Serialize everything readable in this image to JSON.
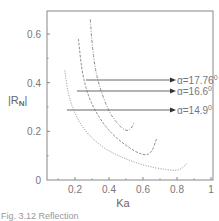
{
  "chart_data": {
    "type": "line",
    "title": "",
    "xlabel": "Ka",
    "ylabel": "|R_N|",
    "xlim": [
      0,
      1
    ],
    "ylim": [
      0,
      0.7
    ],
    "xticks": [
      "0.2",
      "0.4",
      "0.6",
      "0.8",
      "1"
    ],
    "yticks": [
      "0",
      "0.2",
      "0.4",
      "0.6"
    ],
    "grid": false,
    "legend_position": "right-inline-arrows",
    "series": [
      {
        "name": "α=17.76°",
        "style": "dash-dot",
        "x": [
          0.29,
          0.3,
          0.32,
          0.35,
          0.4,
          0.45,
          0.5,
          0.53,
          0.55
        ],
        "y": [
          0.66,
          0.56,
          0.45,
          0.37,
          0.28,
          0.23,
          0.2,
          0.21,
          0.24
        ]
      },
      {
        "name": "α=16.6°",
        "style": "dash",
        "x": [
          0.22,
          0.24,
          0.27,
          0.32,
          0.4,
          0.5,
          0.6,
          0.65,
          0.68
        ],
        "y": [
          0.58,
          0.45,
          0.36,
          0.28,
          0.2,
          0.14,
          0.1,
          0.11,
          0.17
        ]
      },
      {
        "name": "α=14.9°",
        "style": "dotted",
        "x": [
          0.14,
          0.16,
          0.2,
          0.26,
          0.35,
          0.45,
          0.6,
          0.75,
          0.82,
          0.86
        ],
        "y": [
          0.45,
          0.35,
          0.27,
          0.2,
          0.14,
          0.1,
          0.06,
          0.04,
          0.04,
          0.07
        ]
      }
    ],
    "annotations": [
      {
        "text": "α=17.76°",
        "arrow_from": [
          0.29,
          0.41
        ]
      },
      {
        "text": "α=16.6°",
        "arrow_from": [
          0.22,
          0.37
        ]
      },
      {
        "text": "α=14.9°",
        "arrow_from": [
          0.14,
          0.29
        ]
      }
    ]
  },
  "labels": {
    "xlabel": "Ka",
    "ylabel_main": "|R",
    "ylabel_sub": "N",
    "ylabel_end": "|",
    "xticks": [
      "0.2",
      "0.4",
      "0.6",
      "0.8",
      "1"
    ],
    "yticks": [
      "0",
      "0.2",
      "0.4",
      "0.6"
    ],
    "legend": [
      "α=17.76",
      "α=16.6",
      "α=14.9"
    ],
    "degree": "0",
    "caption": "Fig. 3.12  Reflection"
  }
}
